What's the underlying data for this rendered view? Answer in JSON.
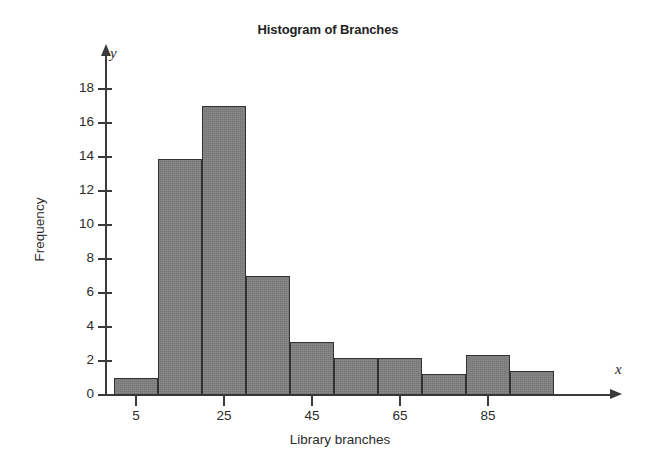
{
  "chart_data": {
    "type": "bar",
    "title": "Histogram of Branches",
    "xlabel": "Library branches",
    "ylabel": "Frequency",
    "x_axis_variable": "x",
    "y_axis_variable": "y",
    "grid": false,
    "legend": null,
    "bin_width": 10,
    "bin_edges": [
      0,
      10,
      20,
      30,
      40,
      50,
      60,
      70,
      80,
      90,
      100
    ],
    "bin_centers": [
      5,
      15,
      25,
      35,
      45,
      55,
      65,
      75,
      85,
      95
    ],
    "categories": [
      "0-10",
      "10-20",
      "20-30",
      "30-40",
      "40-50",
      "50-60",
      "60-70",
      "70-80",
      "80-90",
      "90-100"
    ],
    "values": [
      1,
      13.9,
      17,
      7,
      3.1,
      2.2,
      2.2,
      1.25,
      2.35,
      1.4
    ],
    "xlim": [
      0,
      100
    ],
    "ylim": [
      0,
      19
    ],
    "x_ticks": [
      5,
      25,
      45,
      65,
      85
    ],
    "x_tick_labels": [
      "5",
      "25",
      "45",
      "65",
      "85"
    ],
    "y_ticks": [
      0,
      2,
      4,
      6,
      8,
      10,
      12,
      14,
      16,
      18
    ],
    "y_tick_labels": [
      "0",
      "2",
      "4",
      "6",
      "8",
      "10",
      "12",
      "14",
      "16",
      "18"
    ],
    "bar_color": "#7c7c7c",
    "bar_border_color": "#333333",
    "axis_color": "#3a3a3a",
    "text_color": "#2b2b2b"
  }
}
